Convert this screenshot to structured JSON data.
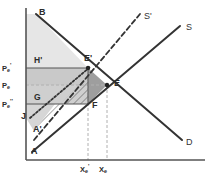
{
  "figure": {
    "kind": "supply-demand-welfare-diagram",
    "background": "#ffffff",
    "line_color": "#333333",
    "axis_color": "#555555",
    "grid_dash_color": "#b0b0b0"
  },
  "axes": {
    "y_axis_name": "price-axis",
    "x_axis_name": "quantity-axis",
    "origin": {
      "x": 26,
      "y": 160
    },
    "y_top": 8,
    "x_right": 205
  },
  "curves": [
    {
      "id": "demand",
      "label": "D",
      "style": "solid",
      "color": "#333333",
      "x1": 36,
      "y1": 14,
      "x2": 182,
      "y2": 140
    },
    {
      "id": "supply",
      "label": "S",
      "style": "solid",
      "color": "#333333",
      "x1": 32,
      "y1": 152,
      "x2": 180,
      "y2": 26
    },
    {
      "id": "supply_new",
      "label": "S'",
      "style": "dashed",
      "color": "#333333",
      "x1": 34,
      "y1": 140,
      "x2": 140,
      "y2": 14
    },
    {
      "id": "marginal_alt",
      "label": "",
      "style": "dotted",
      "color": "#333333",
      "x1": 30,
      "y1": 118,
      "x2": 90,
      "y2": 67
    }
  ],
  "curve_labels": [
    {
      "name": "supply-shift-label",
      "text": "S'",
      "x": 144,
      "y": 12
    },
    {
      "name": "supply-label",
      "text": "S",
      "x": 186,
      "y": 23
    },
    {
      "name": "demand-label",
      "text": "D",
      "x": 186,
      "y": 138
    }
  ],
  "points": [
    {
      "name": "point-B",
      "label": "B",
      "x": 36,
      "y": 14,
      "lx": 39,
      "ly": 8,
      "dot": false
    },
    {
      "name": "point-E",
      "label": "E",
      "x": 107,
      "y": 85,
      "lx": 114,
      "ly": 79,
      "dot": true
    },
    {
      "name": "point-E-prime",
      "label": "E'",
      "x": 88,
      "y": 68,
      "lx": 84,
      "ly": 54,
      "dot": true
    },
    {
      "name": "point-F",
      "label": "F",
      "x": 88,
      "y": 104,
      "lx": 92,
      "ly": 101,
      "dot": false
    },
    {
      "name": "point-A",
      "label": "A",
      "x": 32,
      "y": 152,
      "lx": 31,
      "ly": 147,
      "dot": false
    },
    {
      "name": "point-A-prime",
      "label": "A'",
      "x": 34,
      "y": 131,
      "lx": 33,
      "ly": 125,
      "dot": false
    },
    {
      "name": "point-J",
      "label": "J",
      "x": 27,
      "y": 118,
      "lx": 21,
      "ly": 112,
      "dot": false
    }
  ],
  "region_labels": [
    {
      "name": "region-H-prime",
      "text": "H'",
      "x": 34,
      "y": 56
    },
    {
      "name": "region-G",
      "text": "G",
      "x": 34,
      "y": 93
    }
  ],
  "price_ticks": [
    {
      "name": "price-tick-pe-prime",
      "base": "P",
      "sub": "e",
      "sup": "'",
      "y": 68,
      "label_x": 2
    },
    {
      "name": "price-tick-pe",
      "base": "P",
      "sub": "e",
      "sup": "",
      "y": 85,
      "label_x": 2
    },
    {
      "name": "price-tick-pe-dprime",
      "base": "P",
      "sub": "e",
      "sup": "''",
      "y": 104,
      "label_x": 2
    }
  ],
  "quantity_ticks": [
    {
      "name": "quantity-tick-xe-prime",
      "base": "X",
      "sub": "e",
      "sup": "'",
      "x": 88,
      "label_y": 164
    },
    {
      "name": "quantity-tick-xe",
      "base": "X",
      "sub": "e",
      "sup": "",
      "x": 107,
      "label_y": 164
    }
  ],
  "shaded_regions": [
    {
      "name": "consumer-surplus-upper",
      "fill": "#e6e6e6",
      "points": "26,14 36,14 88,68 26,68"
    },
    {
      "name": "transfer-band-upper",
      "fill": "#c9c9c9",
      "points": "26,68 88,68 88,85 26,85"
    },
    {
      "name": "transfer-band-lower",
      "fill": "#cfcfcf",
      "points": "26,85 88,85 88,104 26,104"
    },
    {
      "name": "deadweight-triangle",
      "fill": "#9e9e9e",
      "points": "88,68 107,85 88,104"
    },
    {
      "name": "producer-surplus-left",
      "fill": "#d6d6d6",
      "points": "26,104 26,118 34,131 55,104"
    }
  ],
  "hatch": {
    "name": "hatched-producer-region",
    "points": "34,131 88,76 88,104 55,104",
    "stroke": "#555555",
    "angle": 45
  },
  "dashed_guides": [
    {
      "name": "guide-xe-prime-vertical",
      "x1": 88,
      "y1": 68,
      "x2": 88,
      "y2": 160
    },
    {
      "name": "guide-xe-vertical",
      "x1": 107,
      "y1": 85,
      "x2": 107,
      "y2": 160
    },
    {
      "name": "guide-pe-horizontal",
      "x1": 26,
      "y1": 85,
      "x2": 107,
      "y2": 85
    }
  ],
  "solid_guides": [
    {
      "name": "guide-pe-prime-horizontal",
      "x1": 26,
      "y1": 68,
      "x2": 88,
      "y2": 68
    },
    {
      "name": "guide-pe-dprime-horizontal",
      "x1": 26,
      "y1": 104,
      "x2": 88,
      "y2": 104
    },
    {
      "name": "guide-f-vertical",
      "x1": 88,
      "y1": 68,
      "x2": 88,
      "y2": 104
    }
  ]
}
